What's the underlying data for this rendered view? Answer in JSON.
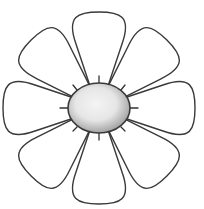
{
  "image": {
    "subject": "flower-line-drawing",
    "petal_count": 8,
    "colors": {
      "background": "#ffffff",
      "petal_fill": "#ffffff",
      "outline": "#3a3a3a",
      "center_light": "#f2f2f2",
      "center_dark": "#a9a9a9",
      "spike": "#333333"
    }
  }
}
